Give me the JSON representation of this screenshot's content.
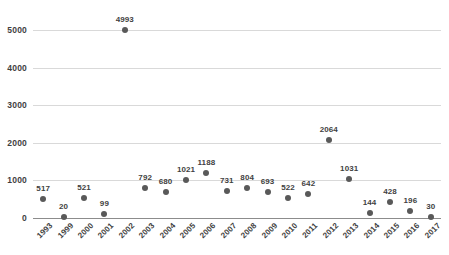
{
  "chart_data": {
    "type": "scatter",
    "title": "",
    "subtitle": "",
    "xlabel": "",
    "ylabel": "",
    "categories": [
      "1993",
      "1999",
      "2000",
      "2001",
      "2002",
      "2003",
      "2004",
      "2005",
      "2006",
      "2007",
      "2008",
      "2009",
      "2010",
      "2011",
      "2012",
      "2013",
      "2014",
      "2015",
      "2016",
      "2017"
    ],
    "values": [
      517,
      20,
      521,
      99,
      4993,
      792,
      680,
      1021,
      1188,
      731,
      804,
      693,
      522,
      642,
      2064,
      1031,
      144,
      428,
      196,
      30
    ],
    "data_labels": [
      "517",
      "20",
      "521",
      "99",
      "4993",
      "792",
      "680",
      "1021",
      "1188",
      "731",
      "804",
      "693",
      "522",
      "642",
      "2064",
      "1031",
      "144",
      "428",
      "196",
      "30"
    ],
    "ylim": [
      0,
      5000
    ],
    "y_ticks": [
      0,
      1000,
      2000,
      3000,
      4000,
      5000
    ],
    "y_tick_labels": [
      "0",
      "1000",
      "2000",
      "3000",
      "4000",
      "5000"
    ],
    "grid": true,
    "grid_axis": "y",
    "legend": false,
    "legend_position": "none",
    "marker": "circle",
    "marker_color": "#595959",
    "gridline_color": "#d9d9d9",
    "axis_color": "#8c8c8c",
    "background_color": "#ffffff",
    "label_color": "#3f3f3f",
    "x_tick_rotation": -45
  }
}
